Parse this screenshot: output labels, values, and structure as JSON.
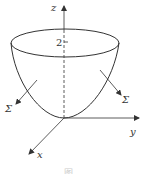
{
  "figure": {
    "type": "paraboloid-surface-diagram",
    "axes": {
      "z_label": "z",
      "y_label": "y",
      "x_label": "x"
    },
    "tick_label": "2",
    "surface_labels": [
      "Σ",
      "Σ"
    ],
    "caption": "图"
  },
  "colors": {
    "stroke": "#333333",
    "background": "#ffffff"
  }
}
